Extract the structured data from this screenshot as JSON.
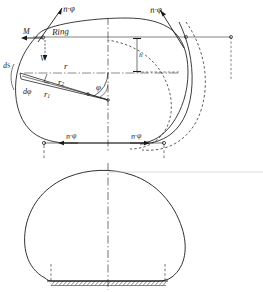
{
  "figure": {
    "ink_color": "#1a1a1a",
    "paper_color": "#ffffff",
    "width": 263,
    "height": 292
  },
  "upper_figure": {
    "name": "upper-cross-section",
    "labels": {
      "force_top_left": "n·φ",
      "force_top_right": "n·φ",
      "moment": "M",
      "ring": "Ring",
      "shear": "V",
      "element_left": "ds",
      "radius_r": "r",
      "radius_r2": "r",
      "radius_r2_sub": "2",
      "radius_r1": "r",
      "radius_r1_sub": "1",
      "angle_dphi": "dφ",
      "angle_phi": "φ",
      "height_h": "h",
      "force_bottom_left": "n·φ",
      "force_bottom_right": "n·φ"
    }
  },
  "lower_figure": {
    "name": "lower-dome-elevation",
    "labels": {
      "base_hatch": "",
      "centerline": ""
    }
  }
}
